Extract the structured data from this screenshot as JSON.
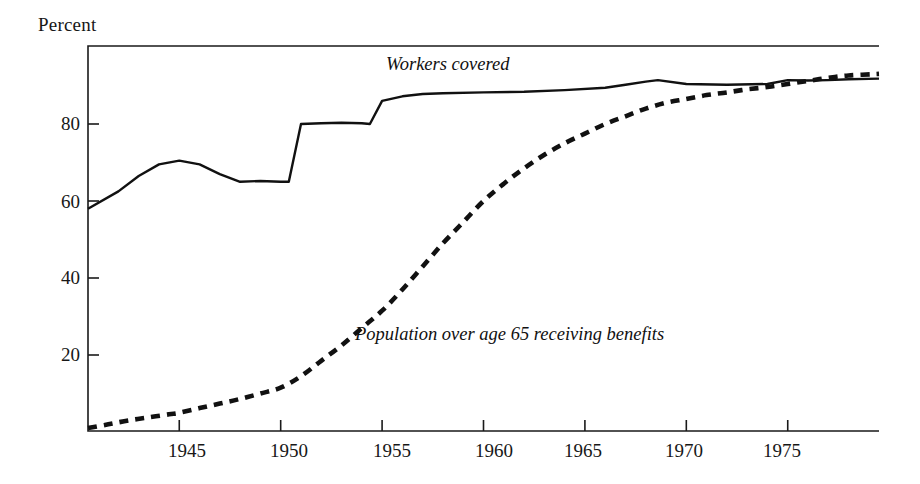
{
  "chart_data": {
    "type": "line",
    "title": "",
    "subtitle": "",
    "ylabel": "Percent",
    "xlabel": "",
    "xlim": [
      1940.5,
      1979.5
    ],
    "ylim": [
      0,
      100
    ],
    "grid": false,
    "legend_position": "inline-annotations",
    "yticks": [
      20,
      40,
      60,
      80
    ],
    "ytick_labels": [
      "20",
      "40",
      "60",
      "80"
    ],
    "xticks": [
      1945,
      1950,
      1955,
      1960,
      1965,
      1970,
      1975
    ],
    "xtick_labels": [
      "1945",
      "1950",
      "1955",
      "1960",
      "1965",
      "1970",
      "1975"
    ],
    "annotations": [
      {
        "text": "Workers covered",
        "x": 1955.0,
        "y": 95.5
      },
      {
        "text": "Population over age 65 receiving benefits",
        "x": 1953.5,
        "y": 26.0
      }
    ],
    "series": [
      {
        "name": "Workers covered",
        "style": "solid",
        "color": "#111111",
        "x": [
          1940.5,
          1942,
          1943,
          1944,
          1945,
          1946,
          1947,
          1948,
          1949,
          1950,
          1950.4,
          1951,
          1952,
          1953,
          1954,
          1954.4,
          1955,
          1956,
          1957,
          1958,
          1960,
          1962,
          1964,
          1966,
          1967,
          1968,
          1968.6,
          1970,
          1972,
          1974,
          1975,
          1976,
          1977,
          1978,
          1979.5
        ],
        "y": [
          58.0,
          62.5,
          66.5,
          69.5,
          70.5,
          69.5,
          67.0,
          65.0,
          65.2,
          65.0,
          65.0,
          80.0,
          80.2,
          80.3,
          80.2,
          80.0,
          86.0,
          87.2,
          87.8,
          88.0,
          88.2,
          88.4,
          88.8,
          89.4,
          90.2,
          91.0,
          91.4,
          90.4,
          90.2,
          90.4,
          91.4,
          91.3,
          91.4,
          91.6,
          91.8
        ]
      },
      {
        "name": "Population over age 65 receiving benefits",
        "style": "dashed",
        "color": "#111111",
        "x": [
          1940.5,
          1941.5,
          1942.5,
          1943.5,
          1944.5,
          1945,
          1946,
          1947,
          1948,
          1949,
          1950,
          1951,
          1952,
          1953,
          1954,
          1955,
          1956,
          1957,
          1958,
          1959,
          1960,
          1961,
          1962,
          1963,
          1964,
          1965,
          1966,
          1967,
          1968,
          1969,
          1970,
          1971,
          1972,
          1973,
          1974,
          1975,
          1976,
          1977,
          1978,
          1979.5
        ],
        "y": [
          1.0,
          2.0,
          3.0,
          3.8,
          4.6,
          5.0,
          6.2,
          7.4,
          8.6,
          10.0,
          11.5,
          14.5,
          18.5,
          22.5,
          27.0,
          31.5,
          37.0,
          43.0,
          49.0,
          54.5,
          60.0,
          64.5,
          68.5,
          72.0,
          75.0,
          77.5,
          80.0,
          82.0,
          84.0,
          85.5,
          86.5,
          87.5,
          88.2,
          89.0,
          89.6,
          90.4,
          91.2,
          92.0,
          92.6,
          93.0
        ]
      }
    ]
  },
  "axes": {
    "ylabel_text": "Percent"
  },
  "colors": {
    "ink": "#111111",
    "background": "#ffffff"
  }
}
